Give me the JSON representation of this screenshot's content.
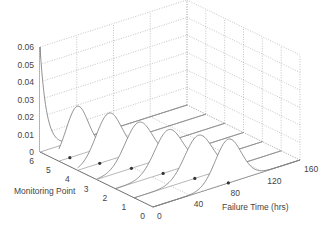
{
  "chart_data": {
    "type": "line",
    "subtype": "3d-waterfall",
    "title": "",
    "xlabel": "Failure Time (hrs)",
    "ylabel": "Monitoring Point",
    "zlabel": "",
    "x_ticks": [
      "0",
      "40",
      "80",
      "120",
      "160"
    ],
    "y_ticks": [
      "0",
      "1",
      "2",
      "3",
      "4",
      "5",
      "6"
    ],
    "z_ticks": [
      "0",
      "0.01",
      "0.02",
      "0.03",
      "0.04",
      "0.05",
      "0.06"
    ],
    "xlim": [
      0,
      160
    ],
    "ylim": [
      0,
      6
    ],
    "zlim": [
      0,
      0.06
    ],
    "grid": true,
    "series": [
      {
        "name": "MP 0",
        "monitoring_point": 0,
        "peak_time": 82,
        "peak_density": 0.025,
        "spread": 14,
        "marker_time": 82
      },
      {
        "name": "MP 1",
        "monitoring_point": 1,
        "peak_time": 70,
        "peak_density": 0.024,
        "spread": 15,
        "marker_time": 66
      },
      {
        "name": "MP 2",
        "monitoring_point": 2,
        "peak_time": 58,
        "peak_density": 0.024,
        "spread": 15,
        "marker_time": 52
      },
      {
        "name": "MP 3",
        "monitoring_point": 3,
        "peak_time": 46,
        "peak_density": 0.025,
        "spread": 15,
        "marker_time": 38
      },
      {
        "name": "MP 4",
        "monitoring_point": 4,
        "peak_time": 34,
        "peak_density": 0.027,
        "spread": 14,
        "marker_time": 24
      },
      {
        "name": "MP 5",
        "monitoring_point": 5,
        "peak_time": 20,
        "peak_density": 0.028,
        "spread": 12,
        "marker_time": 12
      },
      {
        "name": "MP 6",
        "monitoring_point": 6,
        "peak_time": 0,
        "peak_density": 0.06,
        "spread": 6,
        "marker_time": null
      }
    ]
  }
}
